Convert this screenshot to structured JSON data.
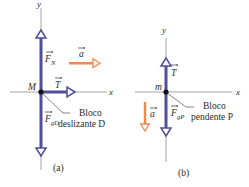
{
  "colors": {
    "axis": "#8a8a8a",
    "force": "#4f4f9a",
    "force_fill": "#ffffff",
    "acceleration": "#ee8a50",
    "text": "#2a2a2a",
    "point": "#111111"
  },
  "panel_a": {
    "caption": "(a)",
    "x_axis_label": "x",
    "y_axis_label": "y",
    "mass_label": "M",
    "forces": [
      {
        "name": "normal-force",
        "label": "F",
        "subscript": "N",
        "direction": "up"
      },
      {
        "name": "tension-force",
        "label": "T",
        "subscript": "",
        "direction": "right"
      },
      {
        "name": "gravity-force",
        "label": "F",
        "subscript": "gD",
        "direction": "down"
      }
    ],
    "acceleration": {
      "label": "a",
      "direction": "right"
    },
    "callout_line1": "Bloco",
    "callout_line2": "deslizante D"
  },
  "panel_b": {
    "caption": "(b)",
    "x_axis_label": "x",
    "y_axis_label": "y",
    "mass_label": "m",
    "forces": [
      {
        "name": "tension-force",
        "label": "T",
        "subscript": "",
        "direction": "up"
      },
      {
        "name": "gravity-force",
        "label": "F",
        "subscript": "gP",
        "direction": "down"
      }
    ],
    "acceleration": {
      "label": "a",
      "direction": "down"
    },
    "callout_line1": "Bloco",
    "callout_line2": "pendente P"
  }
}
